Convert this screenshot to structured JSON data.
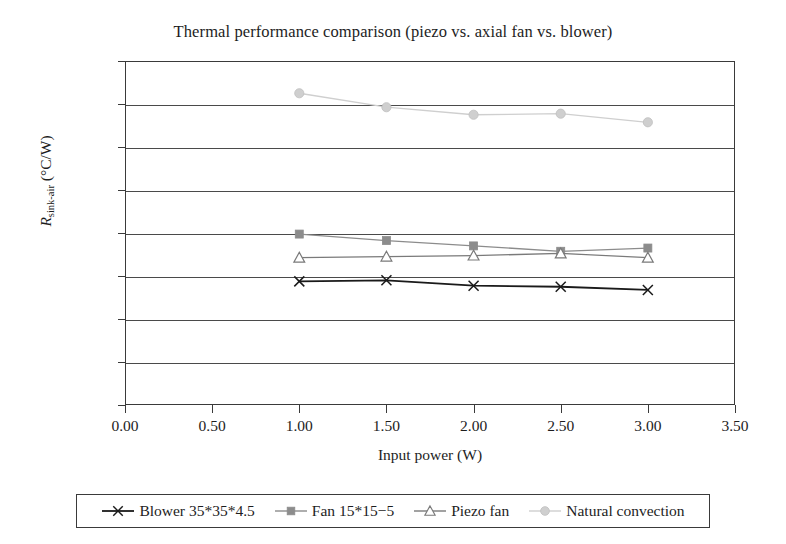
{
  "chart_data": {
    "type": "line",
    "title": "Thermal performance comparison (piezo vs. axial fan vs. blower)",
    "xlabel": "Input power (W)",
    "ylabel": "R_sink-air (°C/W)",
    "ylabel_base": "R",
    "ylabel_sub": "sink-air",
    "ylabel_unit": " (°C/W)",
    "xlim": [
      0.0,
      3.5
    ],
    "ylim": [
      0.0,
      16.0
    ],
    "grid": "horizontal",
    "legend_position": "bottom",
    "x": [
      1.0,
      1.5,
      2.0,
      2.5,
      3.0
    ],
    "xticks": [
      "0.00",
      "0.50",
      "1.00",
      "1.50",
      "2.00",
      "2.50",
      "3.00",
      "3.50"
    ],
    "xtick_values": [
      0.0,
      0.5,
      1.0,
      1.5,
      2.0,
      2.5,
      3.0,
      3.5
    ],
    "yticks": [
      "0.00",
      "2.00",
      "4.00",
      "6.00",
      "8.00",
      "10.00",
      "12.00",
      "14.00",
      "16.00"
    ],
    "ytick_values": [
      0.0,
      2.0,
      4.0,
      6.0,
      8.0,
      10.0,
      12.0,
      14.0,
      16.0
    ],
    "series": [
      {
        "name": "Blower 35*35*4.5",
        "marker": "x-cross",
        "color": "#1a1a1a",
        "values": [
          5.75,
          5.8,
          5.55,
          5.5,
          5.35
        ]
      },
      {
        "name": "Fan 15*15−5",
        "marker": "filled-square",
        "color": "#8c8c8c",
        "values": [
          7.95,
          7.65,
          7.4,
          7.15,
          7.3
        ]
      },
      {
        "name": "Piezo fan",
        "marker": "open-triangle",
        "color": "#7a7a7a",
        "values": [
          6.85,
          6.9,
          6.95,
          7.05,
          6.85
        ]
      },
      {
        "name": "Natural convection",
        "marker": "filled-circle",
        "color": "#cfcfcf",
        "values": [
          14.5,
          13.85,
          13.5,
          13.55,
          13.15
        ]
      }
    ]
  }
}
